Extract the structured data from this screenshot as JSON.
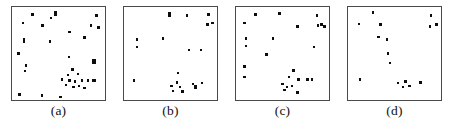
{
  "figure": {
    "type": "multi-panel-scatter",
    "panel_count": 4,
    "background_color": "#ffffff",
    "point_color": "#0d0d0d",
    "border_color": "#4a4a4a",
    "caption_font_size": "13.5px"
  },
  "chart_data": [
    {
      "type": "scatter",
      "title": "",
      "label": "(a)",
      "xlabel": "",
      "ylabel": "",
      "xlim": [
        0,
        100
      ],
      "ylim": [
        0,
        100
      ],
      "grid": false,
      "legend": null,
      "n_points": 33,
      "marker": "square",
      "points": [
        {
          "x": 22,
          "y": 92,
          "w": 2.4,
          "h": 2.4
        },
        {
          "x": 47,
          "y": 93,
          "w": 2.6,
          "h": 5.2
        },
        {
          "x": 91,
          "y": 91,
          "w": 2.4,
          "h": 2.4
        },
        {
          "x": 12,
          "y": 83,
          "w": 2.4,
          "h": 2.4
        },
        {
          "x": 33,
          "y": 80,
          "w": 2.4,
          "h": 2.4
        },
        {
          "x": 85,
          "y": 80,
          "w": 2.4,
          "h": 2.4
        },
        {
          "x": 93,
          "y": 78,
          "w": 2.4,
          "h": 2.4
        },
        {
          "x": 62,
          "y": 73,
          "w": 2.4,
          "h": 2.4
        },
        {
          "x": 78,
          "y": 67,
          "w": 2.4,
          "h": 2.4
        },
        {
          "x": 13,
          "y": 64,
          "w": 2.8,
          "h": 5.4
        },
        {
          "x": 41,
          "y": 63,
          "w": 2.4,
          "h": 2.4
        },
        {
          "x": 7,
          "y": 50,
          "w": 2.4,
          "h": 2.4
        },
        {
          "x": 61,
          "y": 46,
          "w": 2.4,
          "h": 2.4
        },
        {
          "x": 88,
          "y": 41,
          "w": 4.6,
          "h": 5.0
        },
        {
          "x": 15,
          "y": 37,
          "w": 2.4,
          "h": 2.4
        },
        {
          "x": 14,
          "y": 31,
          "w": 2.4,
          "h": 2.4
        },
        {
          "x": 65,
          "y": 33,
          "w": 2.4,
          "h": 2.4
        },
        {
          "x": 60,
          "y": 27,
          "w": 2.4,
          "h": 2.4
        },
        {
          "x": 71,
          "y": 28,
          "w": 2.4,
          "h": 2.4
        },
        {
          "x": 54,
          "y": 22,
          "w": 2.4,
          "h": 2.4
        },
        {
          "x": 62,
          "y": 21,
          "w": 2.4,
          "h": 2.4
        },
        {
          "x": 68,
          "y": 20,
          "w": 2.4,
          "h": 2.4
        },
        {
          "x": 75,
          "y": 21,
          "w": 2.4,
          "h": 2.4
        },
        {
          "x": 82,
          "y": 21,
          "w": 2.4,
          "h": 2.4
        },
        {
          "x": 88,
          "y": 21,
          "w": 4.4,
          "h": 2.4
        },
        {
          "x": 58,
          "y": 16,
          "w": 2.4,
          "h": 2.4
        },
        {
          "x": 66,
          "y": 14,
          "w": 2.4,
          "h": 2.4
        },
        {
          "x": 72,
          "y": 15,
          "w": 2.4,
          "h": 2.4
        },
        {
          "x": 78,
          "y": 13,
          "w": 2.4,
          "h": 2.4
        },
        {
          "x": 8,
          "y": 6,
          "w": 2.4,
          "h": 2.4
        },
        {
          "x": 32,
          "y": 5,
          "w": 2.4,
          "h": 2.4
        },
        {
          "x": 52,
          "y": 3,
          "w": 2.4,
          "h": 2.4
        },
        {
          "x": 42,
          "y": 88,
          "w": 2.4,
          "h": 2.4
        }
      ]
    },
    {
      "type": "scatter",
      "title": "",
      "label": "(b)",
      "xlabel": "",
      "ylabel": "",
      "xlim": [
        0,
        100
      ],
      "ylim": [
        0,
        100
      ],
      "grid": false,
      "legend": null,
      "n_points": 20,
      "marker": "square",
      "points": [
        {
          "x": 49,
          "y": 92,
          "w": 2.8,
          "h": 5.2
        },
        {
          "x": 68,
          "y": 91,
          "w": 2.4,
          "h": 2.4
        },
        {
          "x": 91,
          "y": 92,
          "w": 2.4,
          "h": 2.4
        },
        {
          "x": 90,
          "y": 81,
          "w": 2.6,
          "h": 3.6
        },
        {
          "x": 95,
          "y": 83,
          "w": 2.4,
          "h": 2.4
        },
        {
          "x": 14,
          "y": 65,
          "w": 2.4,
          "h": 2.4
        },
        {
          "x": 42,
          "y": 66,
          "w": 2.4,
          "h": 2.4
        },
        {
          "x": 14,
          "y": 57,
          "w": 2.4,
          "h": 2.4
        },
        {
          "x": 70,
          "y": 54,
          "w": 2.4,
          "h": 2.4
        },
        {
          "x": 83,
          "y": 54,
          "w": 2.4,
          "h": 2.4
        },
        {
          "x": 58,
          "y": 29,
          "w": 2.4,
          "h": 2.4
        },
        {
          "x": 11,
          "y": 21,
          "w": 2.4,
          "h": 2.4
        },
        {
          "x": 57,
          "y": 19,
          "w": 2.4,
          "h": 2.4
        },
        {
          "x": 51,
          "y": 15,
          "w": 2.4,
          "h": 2.4
        },
        {
          "x": 60,
          "y": 14,
          "w": 2.4,
          "h": 2.4
        },
        {
          "x": 53,
          "y": 10,
          "w": 2.4,
          "h": 2.4
        },
        {
          "x": 74,
          "y": 17,
          "w": 2.4,
          "h": 2.4
        },
        {
          "x": 77,
          "y": 14,
          "w": 2.6,
          "h": 3.2
        },
        {
          "x": 84,
          "y": 18,
          "w": 2.4,
          "h": 2.4
        },
        {
          "x": 63,
          "y": 9,
          "w": 2.4,
          "h": 2.4
        }
      ]
    },
    {
      "type": "scatter",
      "title": "",
      "label": "(c)",
      "xlabel": "",
      "ylabel": "",
      "xlim": [
        0,
        100
      ],
      "ylim": [
        0,
        100
      ],
      "grid": false,
      "legend": null,
      "n_points": 25,
      "marker": "square",
      "points": [
        {
          "x": 21,
          "y": 92,
          "w": 2.4,
          "h": 2.4
        },
        {
          "x": 47,
          "y": 93,
          "w": 2.6,
          "h": 3.4
        },
        {
          "x": 87,
          "y": 91,
          "w": 2.4,
          "h": 2.4
        },
        {
          "x": 9,
          "y": 83,
          "w": 2.4,
          "h": 2.4
        },
        {
          "x": 66,
          "y": 79,
          "w": 2.4,
          "h": 2.4
        },
        {
          "x": 88,
          "y": 80,
          "w": 2.4,
          "h": 2.4
        },
        {
          "x": 92,
          "y": 81,
          "w": 2.4,
          "h": 2.4
        },
        {
          "x": 95,
          "y": 79,
          "w": 2.4,
          "h": 2.4
        },
        {
          "x": 11,
          "y": 66,
          "w": 2.4,
          "h": 2.4
        },
        {
          "x": 40,
          "y": 66,
          "w": 2.4,
          "h": 2.4
        },
        {
          "x": 11,
          "y": 58,
          "w": 2.4,
          "h": 2.4
        },
        {
          "x": 84,
          "y": 57,
          "w": 2.4,
          "h": 2.4
        },
        {
          "x": 33,
          "y": 49,
          "w": 2.4,
          "h": 2.4
        },
        {
          "x": 9,
          "y": 36,
          "w": 2.4,
          "h": 2.4
        },
        {
          "x": 62,
          "y": 32,
          "w": 2.6,
          "h": 3.2
        },
        {
          "x": 9,
          "y": 25,
          "w": 2.4,
          "h": 2.4
        },
        {
          "x": 57,
          "y": 25,
          "w": 2.4,
          "h": 2.4
        },
        {
          "x": 67,
          "y": 22,
          "w": 2.4,
          "h": 2.4
        },
        {
          "x": 77,
          "y": 22,
          "w": 2.4,
          "h": 2.4
        },
        {
          "x": 82,
          "y": 22,
          "w": 2.4,
          "h": 2.4
        },
        {
          "x": 50,
          "y": 17,
          "w": 2.4,
          "h": 2.4
        },
        {
          "x": 55,
          "y": 14,
          "w": 2.4,
          "h": 2.4
        },
        {
          "x": 60,
          "y": 15,
          "w": 2.4,
          "h": 2.4
        },
        {
          "x": 52,
          "y": 11,
          "w": 2.4,
          "h": 2.4
        },
        {
          "x": 66,
          "y": 8,
          "w": 2.4,
          "h": 2.4
        }
      ]
    },
    {
      "type": "scatter",
      "title": "",
      "label": "(d)",
      "xlabel": "",
      "ylabel": "",
      "xlim": [
        0,
        100
      ],
      "ylim": [
        0,
        100
      ],
      "grid": false,
      "legend": null,
      "n_points": 16,
      "marker": "square",
      "points": [
        {
          "x": 27,
          "y": 94,
          "w": 2.4,
          "h": 2.4
        },
        {
          "x": 89,
          "y": 91,
          "w": 2.4,
          "h": 2.4
        },
        {
          "x": 12,
          "y": 82,
          "w": 2.4,
          "h": 2.4
        },
        {
          "x": 35,
          "y": 81,
          "w": 2.4,
          "h": 2.4
        },
        {
          "x": 88,
          "y": 79,
          "w": 2.4,
          "h": 2.4
        },
        {
          "x": 95,
          "y": 81,
          "w": 2.4,
          "h": 2.4
        },
        {
          "x": 33,
          "y": 68,
          "w": 2.4,
          "h": 2.4
        },
        {
          "x": 42,
          "y": 65,
          "w": 2.4,
          "h": 2.4
        },
        {
          "x": 43,
          "y": 50,
          "w": 2.4,
          "h": 2.4
        },
        {
          "x": 45,
          "y": 40,
          "w": 2.4,
          "h": 2.4
        },
        {
          "x": 13,
          "y": 22,
          "w": 2.4,
          "h": 2.4
        },
        {
          "x": 54,
          "y": 18,
          "w": 2.4,
          "h": 2.4
        },
        {
          "x": 62,
          "y": 20,
          "w": 2.4,
          "h": 2.4
        },
        {
          "x": 59,
          "y": 14,
          "w": 2.4,
          "h": 2.4
        },
        {
          "x": 66,
          "y": 15,
          "w": 2.4,
          "h": 2.4
        },
        {
          "x": 78,
          "y": 19,
          "w": 2.4,
          "h": 2.4
        }
      ]
    }
  ],
  "panels": [
    {
      "label": "(a)",
      "left": 11,
      "top": 6,
      "width": 95,
      "height": 95,
      "label_top": 104
    },
    {
      "label": "(b)",
      "left": 123,
      "top": 6,
      "width": 95,
      "height": 95,
      "label_top": 104
    },
    {
      "label": "(c)",
      "left": 235,
      "top": 6,
      "width": 95,
      "height": 95,
      "label_top": 104
    },
    {
      "label": "(d)",
      "left": 347,
      "top": 6,
      "width": 95,
      "height": 95,
      "label_top": 104
    }
  ]
}
